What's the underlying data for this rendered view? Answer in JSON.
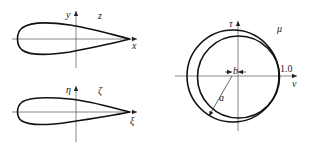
{
  "figure": {
    "panels": [
      {
        "id": "z-plane",
        "plane_label": "z",
        "axis_labels": {
          "horizontal": "x",
          "vertical": "y"
        },
        "shape": "airfoil"
      },
      {
        "id": "zeta-plane",
        "plane_label": "ζ",
        "axis_labels": {
          "horizontal": "ξ",
          "vertical": "η"
        },
        "shape": "airfoil"
      },
      {
        "id": "mu-plane",
        "plane_label": "μ",
        "axis_labels": {
          "horizontal": "ν",
          "vertical": "τ"
        },
        "shape": "two offset circles",
        "annotations": {
          "radius": "a",
          "offset": "b",
          "unit_mark": "1.0"
        }
      }
    ]
  },
  "colors": {
    "curve": "#111111",
    "axis": "#555555",
    "background": "#ffffff"
  }
}
